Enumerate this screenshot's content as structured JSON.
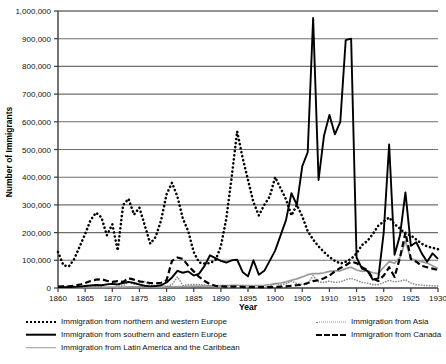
{
  "chart_data": {
    "type": "line",
    "title": "",
    "xlabel": "Year",
    "ylabel": "Number of Immigrants",
    "xlim": [
      1860,
      1930
    ],
    "ylim": [
      0,
      1000000
    ],
    "grid": "horizontal",
    "legend_position": "bottom",
    "xticks": [
      "1860",
      "1865",
      "1870",
      "1875",
      "1880",
      "1885",
      "1890",
      "1895",
      "1900",
      "1905",
      "1910",
      "1915",
      "1920",
      "1925",
      "1930"
    ],
    "yticks": [
      "0",
      "100,000",
      "200,000",
      "300,000",
      "400,000",
      "500,000",
      "600,000",
      "700,000",
      "800,000",
      "900,000",
      "1,000,000"
    ],
    "x": [
      1860,
      1861,
      1862,
      1863,
      1864,
      1865,
      1866,
      1867,
      1868,
      1869,
      1870,
      1871,
      1872,
      1873,
      1874,
      1875,
      1876,
      1877,
      1878,
      1879,
      1880,
      1881,
      1882,
      1883,
      1884,
      1885,
      1886,
      1887,
      1888,
      1889,
      1890,
      1891,
      1892,
      1893,
      1894,
      1895,
      1896,
      1897,
      1898,
      1899,
      1900,
      1901,
      1902,
      1903,
      1904,
      1905,
      1906,
      1907,
      1908,
      1909,
      1910,
      1911,
      1912,
      1913,
      1914,
      1915,
      1916,
      1917,
      1918,
      1919,
      1920,
      1921,
      1922,
      1923,
      1924,
      1925,
      1926,
      1927,
      1928,
      1929,
      1930
    ],
    "series": [
      {
        "name": "Immigration from northern and western Europe",
        "style": "dotted-heavy",
        "color": "#000000",
        "values": [
          130000,
          82000,
          78000,
          105000,
          150000,
          195000,
          245000,
          272000,
          255000,
          190000,
          230000,
          135000,
          300000,
          322000,
          265000,
          290000,
          225000,
          160000,
          185000,
          245000,
          338000,
          380000,
          330000,
          250000,
          205000,
          130000,
          92000,
          88000,
          90000,
          100000,
          150000,
          250000,
          400000,
          565000,
          470000,
          390000,
          310000,
          262000,
          300000,
          330000,
          400000,
          360000,
          320000,
          262000,
          300000,
          258000,
          205000,
          175000,
          150000,
          130000,
          112000,
          98000,
          88000,
          95000,
          105000,
          125000,
          155000,
          170000,
          195000,
          225000,
          240000,
          255000,
          230000,
          215000,
          195000,
          190000,
          175000,
          160000,
          150000,
          145000,
          140000
        ],
        "values_note": "approximate readings from chart"
      },
      {
        "name": "Immigration from southern and eastern Europe",
        "style": "solid-heavy",
        "color": "#000000",
        "values": [
          3000,
          3000,
          3000,
          4000,
          5000,
          7000,
          9000,
          11000,
          10000,
          13000,
          15000,
          13000,
          18000,
          22000,
          18000,
          12000,
          8000,
          6000,
          7000,
          10000,
          20000,
          38000,
          62000,
          55000,
          60000,
          45000,
          52000,
          80000,
          118000,
          108000,
          98000,
          92000,
          100000,
          102000,
          58000,
          42000,
          100000,
          48000,
          62000,
          98000,
          135000,
          190000,
          245000,
          342000,
          300000,
          440000,
          490000,
          975000,
          390000,
          550000,
          625000,
          555000,
          600000,
          895000,
          900000,
          110000,
          70000,
          62000,
          30000,
          35000,
          200000,
          518000,
          120000,
          190000,
          345000,
          152000,
          165000,
          125000,
          95000,
          125000,
          105000
        ],
        "values_note": "approximate readings from chart"
      },
      {
        "name": "Immigration from Latin America and the Caribbean",
        "style": "solid-light",
        "color": "#9a9a9a",
        "values": [
          1500,
          1500,
          1500,
          1500,
          1500,
          2000,
          2000,
          2500,
          2500,
          3000,
          3000,
          3000,
          3500,
          4000,
          4000,
          4000,
          4000,
          3500,
          3500,
          3500,
          4000,
          4500,
          5000,
          5500,
          6000,
          6500,
          7000,
          7000,
          7500,
          8000,
          8500,
          9000,
          10000,
          10000,
          9000,
          9000,
          9000,
          9000,
          10000,
          12000,
          15000,
          18000,
          22000,
          28000,
          33000,
          40000,
          48000,
          52000,
          52000,
          55000,
          60000,
          62000,
          62000,
          70000,
          75000,
          65000,
          60000,
          62000,
          55000,
          52000,
          75000,
          95000,
          90000,
          110000,
          170000,
          105000,
          100000,
          95000,
          90000,
          80000,
          70000
        ],
        "values_note": "approximate readings from chart"
      },
      {
        "name": "Immigration from Asia",
        "style": "dotted-light",
        "color": "#8d8d8d",
        "values": [
          5000,
          7000,
          4000,
          6000,
          3000,
          3000,
          3000,
          4000,
          5000,
          14000,
          15000,
          8000,
          8000,
          20000,
          14000,
          17000,
          23000,
          11000,
          9000,
          10000,
          6000,
          12000,
          40000,
          9000,
          12000,
          13000,
          12000,
          11000,
          6000,
          4000,
          3000,
          3000,
          3000,
          2000,
          2000,
          2000,
          2000,
          2000,
          3000,
          4000,
          18000,
          12000,
          15000,
          25000,
          16000,
          12000,
          15000,
          45000,
          22000,
          20000,
          25000,
          20000,
          22000,
          30000,
          35000,
          28000,
          20000,
          18000,
          12000,
          12000,
          20000,
          28000,
          22000,
          25000,
          30000,
          18000,
          12000,
          10000,
          9000,
          8000,
          8000
        ],
        "values_note": "approximate readings from chart"
      },
      {
        "name": "Immigration from Canada",
        "style": "dashed-heavy",
        "color": "#000000",
        "values": [
          5000,
          6000,
          6000,
          8000,
          12000,
          18000,
          25000,
          30000,
          32000,
          26000,
          22000,
          25000,
          22000,
          35000,
          30000,
          24000,
          21000,
          18000,
          17000,
          19000,
          28000,
          98000,
          110000,
          105000,
          80000,
          60000,
          40000,
          25000,
          14000,
          8000,
          6000,
          5000,
          5000,
          5000,
          4000,
          3000,
          3000,
          3000,
          3000,
          3000,
          4000,
          5000,
          6000,
          8000,
          10000,
          12000,
          18000,
          25000,
          28000,
          35000,
          45000,
          60000,
          72000,
          82000,
          95000,
          90000,
          75000,
          65000,
          35000,
          25000,
          45000,
          75000,
          40000,
          110000,
          200000,
          105000,
          95000,
          80000,
          75000,
          70000,
          65000
        ],
        "values_note": "approximate readings from chart"
      }
    ]
  },
  "legend": {
    "left_column": [
      {
        "label": "Immigration from northern and western Europe",
        "swatch": "dotted-heavy-black"
      },
      {
        "label": "Immigration from southern and eastern Europe",
        "swatch": "solid-heavy-black"
      },
      {
        "label": "Immigration from Latin America and the Caribbean",
        "swatch": "solid-light-gray"
      }
    ],
    "right_column": [
      {
        "label": "Immigration from Asia",
        "swatch": "dotted-light-gray"
      },
      {
        "label": "Immigration from Canada",
        "swatch": "dashed-heavy-black"
      }
    ]
  },
  "axes": {
    "y_title": "Number of Immigrants",
    "x_title": "Year"
  },
  "colors": {
    "series_black": "#000000",
    "series_gray": "#9a9a9a",
    "gridline": "#6e6e6e",
    "axis": "#3a3a3a",
    "background": "#ffffff"
  }
}
